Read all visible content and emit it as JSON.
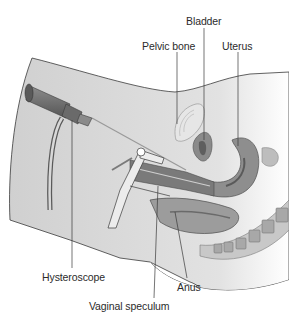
{
  "figure": {
    "type": "medical-illustration",
    "palette": {
      "skin": "#d4d4d4",
      "skin_dark": "#b8b8b8",
      "organ_mid": "#9a9a9a",
      "organ_dark": "#6e6e6e",
      "instrument": "#7a7a7a",
      "outline": "#3a3a3a",
      "text": "#2b2b2b"
    }
  },
  "labels": {
    "bladder": "Bladder",
    "pelvic_bone": "Pelvic bone",
    "uterus": "Uterus",
    "hysteroscope": "Hysteroscope",
    "anus": "Anus",
    "vaginal_speculum": "Vaginal speculum"
  }
}
